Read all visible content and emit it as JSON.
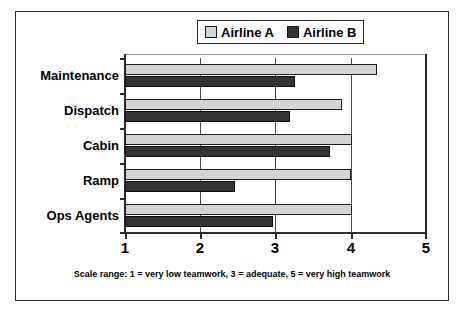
{
  "chart_data": {
    "type": "bar",
    "orientation": "horizontal",
    "title": "",
    "xlabel": "",
    "ylabel": "",
    "xlim": [
      1,
      5
    ],
    "xticks": [
      "1",
      "2",
      "3",
      "4",
      "5"
    ],
    "grid": true,
    "legend_position": "top-center",
    "categories": [
      "Maintenance",
      "Dispatch",
      "Cabin",
      "Ramp",
      "Ops Agents"
    ],
    "series": [
      {
        "name": "Airline A",
        "color": "#d4d4d4",
        "values": [
          4.35,
          3.88,
          4.02,
          4.0,
          4.02
        ]
      },
      {
        "name": "Airline B",
        "color": "#333333",
        "values": [
          3.26,
          3.19,
          3.72,
          2.46,
          2.97
        ]
      }
    ],
    "caption": "Scale range: 1 = very low teamwork, 3 = adequate, 5 = very high teamwork"
  },
  "legend": {
    "items": [
      {
        "label": "Airline A",
        "swatch": "legend-swatch-light"
      },
      {
        "label": "Airline B",
        "swatch": "legend-swatch-dark"
      }
    ]
  },
  "axis": {
    "x_tick_labels": [
      "1",
      "2",
      "3",
      "4",
      "5"
    ],
    "category_labels": [
      "Maintenance",
      "Dispatch",
      "Cabin",
      "Ramp",
      "Ops Agents"
    ]
  },
  "caption": {
    "text": "Scale range: 1 = very low teamwork, 3 = adequate, 5 = very high teamwork"
  }
}
